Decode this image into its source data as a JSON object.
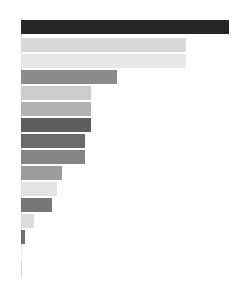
{
  "chart_data": {
    "type": "bar",
    "orientation": "horizontal",
    "title": "",
    "subtitle": "",
    "xlabel": "",
    "ylabel": "",
    "grid": false,
    "legend": null,
    "legend_position": "none",
    "axis": {
      "y_axis_visible": true,
      "y_axis_color": "#d8d8d8",
      "x_axis_visible": false,
      "tick_labels_visible": false,
      "xlim": [
        0,
        212
      ],
      "categories_visible": false
    },
    "background_color": "#ffffff",
    "categories": [
      "bar-1",
      "bar-2",
      "bar-3",
      "bar-4",
      "bar-5",
      "bar-6",
      "bar-7",
      "bar-8",
      "bar-9",
      "bar-10",
      "bar-11",
      "bar-12",
      "bar-13",
      "bar-14",
      "bar-15"
    ],
    "values": [
      208,
      165,
      165,
      96,
      70,
      70,
      70,
      64,
      64,
      41,
      36,
      31,
      13,
      4,
      1
    ],
    "colors": [
      "#262626",
      "#d9d9d9",
      "#e8e8e8",
      "#8c8c8c",
      "#cccccc",
      "#b3b3b3",
      "#5e5e5e",
      "#6b6b6b",
      "#848484",
      "#9c9c9c",
      "#e3e3e3",
      "#777777",
      "#dcdcdc",
      "#6f6f6f",
      "#eeeeee"
    ],
    "bars": [
      {
        "name": "bar-1",
        "value": 208,
        "color": "#262626",
        "x": 21,
        "y": 20,
        "width": 208,
        "height": 14
      },
      {
        "name": "bar-2",
        "value": 165,
        "color": "#d9d9d9",
        "x": 21,
        "y": 38,
        "width": 165,
        "height": 14
      },
      {
        "name": "bar-3",
        "value": 165,
        "color": "#e8e8e8",
        "x": 21,
        "y": 54,
        "width": 165,
        "height": 14
      },
      {
        "name": "bar-4",
        "value": 96,
        "color": "#8c8c8c",
        "x": 21,
        "y": 70,
        "width": 96,
        "height": 14
      },
      {
        "name": "bar-5",
        "value": 70,
        "color": "#cccccc",
        "x": 21,
        "y": 86,
        "width": 70,
        "height": 14
      },
      {
        "name": "bar-6",
        "value": 70,
        "color": "#b3b3b3",
        "x": 21,
        "y": 102,
        "width": 70,
        "height": 14
      },
      {
        "name": "bar-7",
        "value": 70,
        "color": "#5e5e5e",
        "x": 21,
        "y": 118,
        "width": 70,
        "height": 14
      },
      {
        "name": "bar-8",
        "value": 64,
        "color": "#6b6b6b",
        "x": 21,
        "y": 134,
        "width": 64,
        "height": 14
      },
      {
        "name": "bar-9",
        "value": 64,
        "color": "#848484",
        "x": 21,
        "y": 150,
        "width": 64,
        "height": 14
      },
      {
        "name": "bar-10",
        "value": 41,
        "color": "#9c9c9c",
        "x": 21,
        "y": 166,
        "width": 41,
        "height": 14
      },
      {
        "name": "bar-11",
        "value": 36,
        "color": "#e3e3e3",
        "x": 21,
        "y": 182,
        "width": 36,
        "height": 14
      },
      {
        "name": "bar-12",
        "value": 31,
        "color": "#777777",
        "x": 21,
        "y": 198,
        "width": 31,
        "height": 14
      },
      {
        "name": "bar-13",
        "value": 13,
        "color": "#dcdcdc",
        "x": 21,
        "y": 214,
        "width": 13,
        "height": 14
      },
      {
        "name": "bar-14",
        "value": 4,
        "color": "#6f6f6f",
        "x": 21,
        "y": 230,
        "width": 4,
        "height": 14
      },
      {
        "name": "bar-15",
        "value": 1,
        "color": "#eeeeee",
        "x": 21,
        "y": 246,
        "width": 1,
        "height": 14
      }
    ],
    "axis_line": {
      "x": 21,
      "y": 18,
      "width": 1,
      "height": 260,
      "color": "#d8d8d8"
    }
  }
}
